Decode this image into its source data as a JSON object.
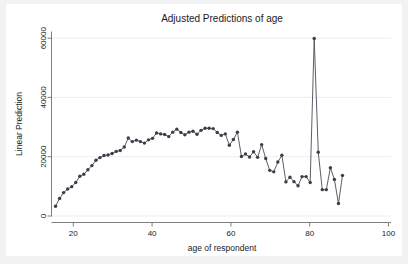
{
  "figure": {
    "background_color": "#f2f2f2",
    "plot_background_color": "#ffffff"
  },
  "chart_data": {
    "type": "line",
    "title": "Adjusted Predictions of age",
    "subtitle": "",
    "xlabel": "age of respondent",
    "ylabel": "Linear Prediction",
    "xlim": [
      17,
      101
    ],
    "ylim": [
      0,
      62000
    ],
    "xticks": [
      20,
      40,
      60,
      80,
      100
    ],
    "xtick_labels": [
      "20",
      "40",
      "60",
      "80",
      "100"
    ],
    "yticks": [
      0,
      20000,
      40000,
      60000
    ],
    "ytick_labels": [
      "0",
      "20000",
      "40000",
      "60000"
    ],
    "grid": "horizontal",
    "legend": "none",
    "marker": "circle",
    "line_color": "#4c4c57",
    "marker_color": "#3d3d48",
    "grid_color": "#e8e8e8",
    "axis_color": "#6f6f6f",
    "series": [
      {
        "name": "Linear Prediction",
        "x": [
          18,
          19,
          20,
          21,
          22,
          23,
          24,
          25,
          26,
          27,
          28,
          29,
          30,
          31,
          32,
          33,
          34,
          35,
          36,
          37,
          38,
          39,
          40,
          41,
          42,
          43,
          44,
          45,
          46,
          47,
          48,
          49,
          50,
          51,
          52,
          53,
          54,
          55,
          56,
          57,
          58,
          59,
          60,
          61,
          62,
          63,
          64,
          65,
          66,
          67,
          68,
          69,
          70,
          71,
          72,
          73,
          74,
          75,
          76,
          77,
          78,
          79,
          80,
          81,
          82,
          83,
          84,
          85,
          86,
          87,
          88,
          89
        ],
        "values": [
          3300,
          5900,
          7900,
          9100,
          9900,
          11300,
          13400,
          14100,
          15600,
          17000,
          18800,
          19700,
          20400,
          20600,
          21100,
          21800,
          22100,
          23300,
          26300,
          25100,
          25600,
          25100,
          24600,
          25700,
          26200,
          28000,
          27700,
          27500,
          26800,
          28300,
          29300,
          28200,
          27400,
          28300,
          28600,
          27600,
          28900,
          29600,
          29600,
          29500,
          28200,
          27200,
          27700,
          23900,
          25800,
          28300,
          20100,
          20900,
          19900,
          21700,
          19800,
          24100,
          19400,
          15400,
          14900,
          18200,
          20500,
          11500,
          13100,
          11600,
          10200,
          13300,
          13300,
          11300,
          59900,
          21500,
          8900,
          8900,
          16300,
          12300,
          4200,
          13700
        ]
      }
    ]
  },
  "axes": {
    "title_label": "Adjusted Predictions of age",
    "x_axis_label": "age of respondent",
    "y_axis_label": "Linear Prediction"
  }
}
